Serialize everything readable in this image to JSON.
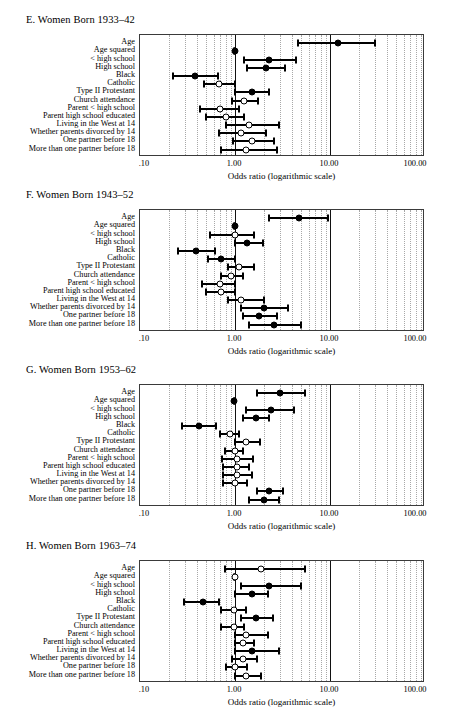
{
  "figure": {
    "axis_title": "Odds ratio (logarithmic scale)",
    "x_tick_labels": [
      ".10",
      "1.00",
      "10.00",
      "100.00"
    ],
    "x_tick_values": [
      0.1,
      1,
      10,
      100
    ],
    "row_labels": [
      "Age",
      "Age squared",
      "< high school",
      "High school",
      "Black",
      "Catholic",
      "Type II Protestant",
      "Church attendance",
      "Parent < high school",
      "Parent high school educated",
      "Living in the West at 14",
      "Whether parents divorced by 14",
      "One partner before 18",
      "More than one partner before 18"
    ]
  },
  "chart_data": [
    {
      "type": "scatter",
      "panel_id": "E",
      "title": "E. Women Born 1933–42",
      "xlabel": "Odds ratio (logarithmic scale)",
      "ylabel": "",
      "xscale": "log",
      "xlim": [
        0.1,
        100
      ],
      "reference_line": 1.0,
      "grid": true,
      "categories": [
        "Age",
        "Age squared",
        "< high school",
        "High school",
        "Black",
        "Catholic",
        "Type II Protestant",
        "Church attendance",
        "Parent < high school",
        "Parent high school educated",
        "Living in the West at 14",
        "Whether parents divorced by 14",
        "One partner before 18",
        "More than one partner before 18"
      ],
      "points": [
        {
          "label": "Age",
          "odds_ratio": 12.0,
          "ci_low": 4.6,
          "ci_high": 30.0,
          "significant": true
        },
        {
          "label": "Age squared",
          "odds_ratio": 0.99,
          "ci_low": 0.985,
          "ci_high": 0.995,
          "significant": true
        },
        {
          "label": "< high school",
          "odds_ratio": 2.3,
          "ci_low": 1.25,
          "ci_high": 4.4,
          "significant": true
        },
        {
          "label": "High school",
          "odds_ratio": 2.1,
          "ci_low": 1.35,
          "ci_high": 3.4,
          "significant": true
        },
        {
          "label": "Black",
          "odds_ratio": 0.38,
          "ci_low": 0.22,
          "ci_high": 0.67,
          "significant": true
        },
        {
          "label": "Catholic",
          "odds_ratio": 0.68,
          "ci_low": 0.47,
          "ci_high": 1.0,
          "significant": false
        },
        {
          "label": "Type II Protestant",
          "odds_ratio": 1.5,
          "ci_low": 1.0,
          "ci_high": 2.3,
          "significant": true
        },
        {
          "label": "Church attendance",
          "odds_ratio": 1.25,
          "ci_low": 0.93,
          "ci_high": 1.75,
          "significant": false
        },
        {
          "label": "Parent < high school",
          "odds_ratio": 0.69,
          "ci_low": 0.43,
          "ci_high": 1.1,
          "significant": false
        },
        {
          "label": "Parent high school educated",
          "odds_ratio": 0.8,
          "ci_low": 0.5,
          "ci_high": 1.25,
          "significant": false
        },
        {
          "label": "Living in the West at 14",
          "odds_ratio": 1.4,
          "ci_low": 0.8,
          "ci_high": 2.9,
          "significant": false
        },
        {
          "label": "Whether parents divorced by 14",
          "odds_ratio": 1.15,
          "ci_low": 0.68,
          "ci_high": 2.1,
          "significant": false
        },
        {
          "label": "One partner before 18",
          "odds_ratio": 1.5,
          "ci_low": 0.95,
          "ci_high": 2.6,
          "significant": false
        },
        {
          "label": "More than one partner before 18",
          "odds_ratio": 1.3,
          "ci_low": 0.72,
          "ci_high": 2.8,
          "significant": false
        }
      ]
    },
    {
      "type": "scatter",
      "panel_id": "F",
      "title": "F. Women Born 1943–52",
      "xlabel": "Odds ratio (logarithmic scale)",
      "ylabel": "",
      "xscale": "log",
      "xlim": [
        0.1,
        100
      ],
      "reference_line": 1.0,
      "grid": true,
      "categories": [
        "Age",
        "Age squared",
        "< high school",
        "High school",
        "Black",
        "Catholic",
        "Type II Protestant",
        "Church attendance",
        "Parent < high school",
        "Parent high school educated",
        "Living in the West at 14",
        "Whether parents divorced by 14",
        "One partner before 18",
        "More than one partner before 18"
      ],
      "points": [
        {
          "label": "Age",
          "odds_ratio": 4.7,
          "ci_low": 2.3,
          "ci_high": 9.6,
          "significant": true
        },
        {
          "label": "Age squared",
          "odds_ratio": 0.99,
          "ci_low": 0.985,
          "ci_high": 0.995,
          "significant": true
        },
        {
          "label": "< high school",
          "odds_ratio": 1.0,
          "ci_low": 0.55,
          "ci_high": 1.6,
          "significant": false
        },
        {
          "label": "High school",
          "odds_ratio": 1.35,
          "ci_low": 1.0,
          "ci_high": 1.95,
          "significant": true
        },
        {
          "label": "Black",
          "odds_ratio": 0.39,
          "ci_low": 0.25,
          "ci_high": 0.62,
          "significant": true
        },
        {
          "label": "Catholic",
          "odds_ratio": 0.72,
          "ci_low": 0.52,
          "ci_high": 1.0,
          "significant": true
        },
        {
          "label": "Type II Protestant",
          "odds_ratio": 1.1,
          "ci_low": 0.85,
          "ci_high": 1.6,
          "significant": false
        },
        {
          "label": "Church attendance",
          "odds_ratio": 0.9,
          "ci_low": 0.72,
          "ci_high": 1.2,
          "significant": false
        },
        {
          "label": "Parent < high school",
          "odds_ratio": 0.7,
          "ci_low": 0.45,
          "ci_high": 1.0,
          "significant": false
        },
        {
          "label": "Parent high school educated",
          "odds_ratio": 0.72,
          "ci_low": 0.5,
          "ci_high": 1.0,
          "significant": false
        },
        {
          "label": "Living in the West at 14",
          "odds_ratio": 1.15,
          "ci_low": 0.85,
          "ci_high": 2.0,
          "significant": false
        },
        {
          "label": "Whether parents divorced by 14",
          "odds_ratio": 2.0,
          "ci_low": 1.15,
          "ci_high": 3.6,
          "significant": true
        },
        {
          "label": "One partner before 18",
          "odds_ratio": 1.8,
          "ci_low": 1.2,
          "ci_high": 2.8,
          "significant": true
        },
        {
          "label": "More than one partner before 18",
          "odds_ratio": 2.6,
          "ci_low": 1.4,
          "ci_high": 5.0,
          "significant": true
        }
      ]
    },
    {
      "type": "scatter",
      "panel_id": "G",
      "title": "G. Women Born 1953–62",
      "xlabel": "Odds ratio (logarithmic scale)",
      "ylabel": "",
      "xscale": "log",
      "xlim": [
        0.1,
        100
      ],
      "reference_line": 1.0,
      "grid": true,
      "categories": [
        "Age",
        "Age squared",
        "< high school",
        "High school",
        "Black",
        "Catholic",
        "Type II Protestant",
        "Church attendance",
        "Parent < high school",
        "Parent high school educated",
        "Living in the West at 14",
        "Whether parents divorced by 14",
        "One partner before 18",
        "More than one partner before 18"
      ],
      "points": [
        {
          "label": "Age",
          "odds_ratio": 3.0,
          "ci_low": 1.7,
          "ci_high": 5.5,
          "significant": true
        },
        {
          "label": "Age squared",
          "odds_ratio": 0.98,
          "ci_low": 0.975,
          "ci_high": 0.99,
          "significant": true
        },
        {
          "label": "< high school",
          "odds_ratio": 2.4,
          "ci_low": 1.3,
          "ci_high": 4.2,
          "significant": true
        },
        {
          "label": "High school",
          "odds_ratio": 1.65,
          "ci_low": 1.2,
          "ci_high": 2.3,
          "significant": true
        },
        {
          "label": "Black",
          "odds_ratio": 0.42,
          "ci_low": 0.28,
          "ci_high": 0.63,
          "significant": true
        },
        {
          "label": "Catholic",
          "odds_ratio": 0.88,
          "ci_low": 0.7,
          "ci_high": 1.1,
          "significant": false
        },
        {
          "label": "Type II Protestant",
          "odds_ratio": 1.3,
          "ci_low": 1.0,
          "ci_high": 1.85,
          "significant": false
        },
        {
          "label": "Church attendance",
          "odds_ratio": 1.0,
          "ci_low": 0.78,
          "ci_high": 1.2,
          "significant": false
        },
        {
          "label": "Parent < high school",
          "odds_ratio": 1.05,
          "ci_low": 0.73,
          "ci_high": 1.55,
          "significant": false
        },
        {
          "label": "Parent high school educated",
          "odds_ratio": 1.05,
          "ci_low": 0.75,
          "ci_high": 1.4,
          "significant": false
        },
        {
          "label": "Living in the West at 14",
          "odds_ratio": 1.05,
          "ci_low": 0.75,
          "ci_high": 1.5,
          "significant": false
        },
        {
          "label": "Whether parents divorced by 14",
          "odds_ratio": 1.0,
          "ci_low": 0.75,
          "ci_high": 1.35,
          "significant": false
        },
        {
          "label": "One partner before 18",
          "odds_ratio": 2.3,
          "ci_low": 1.7,
          "ci_high": 3.2,
          "significant": true
        },
        {
          "label": "More than one partner before 18",
          "odds_ratio": 2.0,
          "ci_low": 1.4,
          "ci_high": 2.9,
          "significant": true
        }
      ]
    },
    {
      "type": "scatter",
      "panel_id": "H",
      "title": "H. Women Born 1963–74",
      "xlabel": "Odds ratio (logarithmic scale)",
      "ylabel": "",
      "xscale": "log",
      "xlim": [
        0.1,
        100
      ],
      "reference_line": 1.0,
      "grid": true,
      "categories": [
        "Age",
        "Age squared",
        "< high school",
        "High school",
        "Black",
        "Catholic",
        "Type II Protestant",
        "Church attendance",
        "Parent < high school",
        "Parent high school educated",
        "Living in the West at 14",
        "Whether parents divorced by 14",
        "One partner before 18",
        "More than one partner before 18"
      ],
      "points": [
        {
          "label": "Age",
          "odds_ratio": 1.9,
          "ci_low": 0.78,
          "ci_high": 5.4,
          "significant": false
        },
        {
          "label": "Age squared",
          "odds_ratio": 0.99,
          "ci_low": 0.985,
          "ci_high": 0.997,
          "significant": false
        },
        {
          "label": "< high school",
          "odds_ratio": 2.3,
          "ci_low": 1.15,
          "ci_high": 4.9,
          "significant": true
        },
        {
          "label": "High school",
          "odds_ratio": 1.5,
          "ci_low": 1.0,
          "ci_high": 2.2,
          "significant": true
        },
        {
          "label": "Black",
          "odds_ratio": 0.46,
          "ci_low": 0.29,
          "ci_high": 0.68,
          "significant": true
        },
        {
          "label": "Catholic",
          "odds_ratio": 0.97,
          "ci_low": 0.72,
          "ci_high": 1.3,
          "significant": false
        },
        {
          "label": "Type II Protestant",
          "odds_ratio": 1.65,
          "ci_low": 1.15,
          "ci_high": 2.5,
          "significant": true
        },
        {
          "label": "Church attendance",
          "odds_ratio": 0.97,
          "ci_low": 0.72,
          "ci_high": 1.25,
          "significant": false
        },
        {
          "label": "Parent < high school",
          "odds_ratio": 1.3,
          "ci_low": 1.0,
          "ci_high": 2.2,
          "significant": false
        },
        {
          "label": "Parent high school educated",
          "odds_ratio": 1.2,
          "ci_low": 1.0,
          "ci_high": 1.6,
          "significant": false
        },
        {
          "label": "Living in the West at 14",
          "odds_ratio": 1.5,
          "ci_low": 1.0,
          "ci_high": 2.9,
          "significant": true
        },
        {
          "label": "Whether parents divorced by 14",
          "odds_ratio": 1.2,
          "ci_low": 0.93,
          "ci_high": 1.7,
          "significant": false
        },
        {
          "label": "One partner before 18",
          "odds_ratio": 1.0,
          "ci_low": 0.8,
          "ci_high": 1.35,
          "significant": false
        },
        {
          "label": "More than one partner before 18",
          "odds_ratio": 1.3,
          "ci_low": 1.0,
          "ci_high": 1.9,
          "significant": false
        }
      ]
    }
  ]
}
